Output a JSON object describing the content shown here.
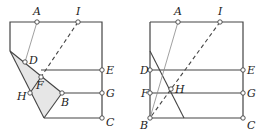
{
  "figures": [
    {
      "id": "left",
      "description": "Folded square paper, fold shown shaded",
      "colors": {
        "line": "#444444",
        "shade": "#e6e6e6",
        "thin": "#888888"
      },
      "frame": [
        [
          10,
          51
        ],
        [
          10,
          22
        ],
        [
          102,
          22
        ],
        [
          102,
          118
        ],
        [
          44,
          118
        ]
      ],
      "shaded_polygon": [
        [
          10,
          51
        ],
        [
          62,
          93
        ],
        [
          44,
          118
        ]
      ],
      "points": {
        "A": {
          "x": 37,
          "y": 22,
          "label": "A",
          "lx": 33,
          "ly": 15
        },
        "I": {
          "x": 78,
          "y": 22,
          "label": "I",
          "lx": 76,
          "ly": 15
        },
        "D": {
          "x": 25,
          "y": 62,
          "label": "D",
          "lx": 29,
          "ly": 64
        },
        "E": {
          "x": 102,
          "y": 70,
          "label": "E",
          "lx": 106,
          "ly": 74
        },
        "F": {
          "x": 41,
          "y": 77,
          "label": "F",
          "lx": 36,
          "ly": 89
        },
        "H": {
          "x": 30,
          "y": 93,
          "label": "H",
          "lx": 17,
          "ly": 100
        },
        "B": {
          "x": 62,
          "y": 93,
          "label": "B",
          "lx": 61,
          "ly": 106
        },
        "G": {
          "x": 102,
          "y": 93,
          "label": "G",
          "lx": 106,
          "ly": 97
        },
        "C": {
          "x": 102,
          "y": 118,
          "label": "C",
          "lx": 106,
          "ly": 126
        }
      },
      "segments": [
        {
          "from": [
            41,
            70
          ],
          "to": [
            102,
            70
          ],
          "style": "solid"
        },
        {
          "from": [
            62,
            93
          ],
          "to": [
            102,
            93
          ],
          "style": "solid"
        },
        {
          "from": [
            30,
            93
          ],
          "to": [
            41,
            77
          ],
          "style": "solid"
        },
        {
          "from": [
            10,
            51
          ],
          "to": [
            62,
            93
          ],
          "style": "solid"
        },
        {
          "from": [
            62,
            93
          ],
          "to": [
            44,
            118
          ],
          "style": "solid"
        },
        {
          "from": [
            10,
            51
          ],
          "to": [
            44,
            118
          ],
          "style": "solid"
        },
        {
          "from": [
            37,
            22
          ],
          "to": [
            25,
            62
          ],
          "style": "thin"
        },
        {
          "from": [
            78,
            22
          ],
          "to": [
            41,
            77
          ],
          "style": "dashed"
        }
      ]
    },
    {
      "id": "right",
      "description": "Unfolded square paper with crease lines",
      "colors": {
        "line": "#444444",
        "thin": "#888888"
      },
      "frame": [
        [
          150,
          22
        ],
        [
          243,
          22
        ],
        [
          243,
          118
        ],
        [
          150,
          118
        ]
      ],
      "points": {
        "A": {
          "x": 178,
          "y": 22,
          "label": "A",
          "lx": 174,
          "ly": 15
        },
        "I": {
          "x": 220,
          "y": 22,
          "label": "I",
          "lx": 218,
          "ly": 15
        },
        "D": {
          "x": 150,
          "y": 70,
          "label": "D",
          "lx": 140,
          "ly": 74
        },
        "E": {
          "x": 243,
          "y": 70,
          "label": "E",
          "lx": 247,
          "ly": 74
        },
        "F": {
          "x": 150,
          "y": 93,
          "label": "F",
          "lx": 141,
          "ly": 97
        },
        "H": {
          "x": 171,
          "y": 89,
          "label": "H",
          "lx": 175,
          "ly": 93
        },
        "G": {
          "x": 243,
          "y": 93,
          "label": "G",
          "lx": 247,
          "ly": 97
        },
        "B": {
          "x": 150,
          "y": 118,
          "label": "B",
          "lx": 140,
          "ly": 129
        },
        "C": {
          "x": 243,
          "y": 118,
          "label": "C",
          "lx": 247,
          "ly": 129
        }
      },
      "segments": [
        {
          "from": [
            150,
            70
          ],
          "to": [
            243,
            70
          ],
          "style": "solid"
        },
        {
          "from": [
            150,
            93
          ],
          "to": [
            243,
            93
          ],
          "style": "solid"
        },
        {
          "from": [
            150,
            51
          ],
          "to": [
            184,
            118
          ],
          "style": "solid"
        },
        {
          "from": [
            178,
            22
          ],
          "to": [
            150,
            118
          ],
          "style": "thin"
        },
        {
          "from": [
            220,
            22
          ],
          "to": [
            150,
            118
          ],
          "style": "dashed"
        }
      ]
    }
  ]
}
